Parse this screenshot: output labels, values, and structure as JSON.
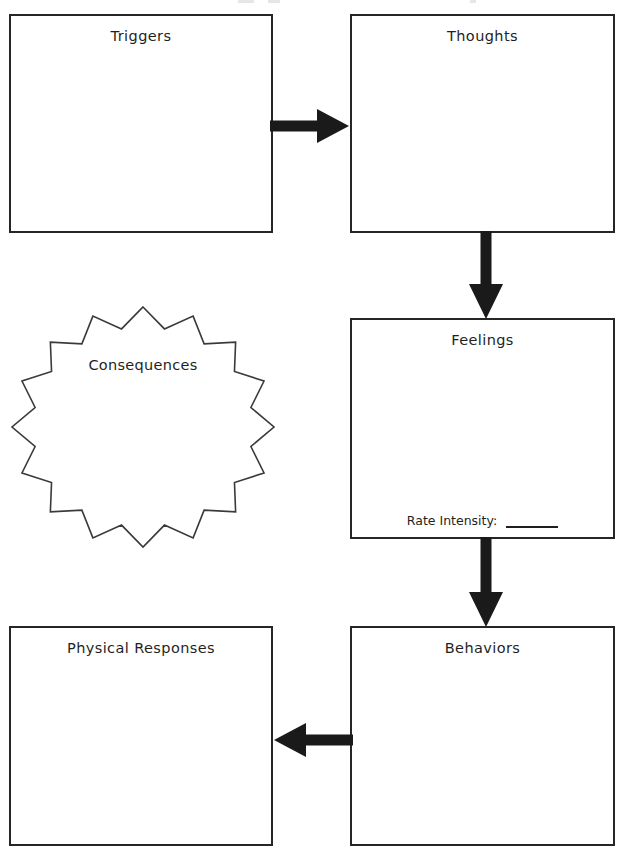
{
  "worksheet": {
    "title": "CBT Cycle Worksheet",
    "background_color": "#ffffff",
    "line_color": "#262626",
    "text_color": "#1f1f1f"
  },
  "boxes": [
    {
      "id": "triggers",
      "label": "Triggers"
    },
    {
      "id": "thoughts",
      "label": "Thoughts"
    },
    {
      "id": "feelings",
      "label": "Feelings"
    },
    {
      "id": "behaviors",
      "label": "Behaviors"
    },
    {
      "id": "physical",
      "label": "Physical Responses"
    }
  ],
  "feelings": {
    "label": "Feelings",
    "rate_intensity_label": "Rate Intensity:",
    "rate_intensity_value": ""
  },
  "starburst": {
    "label": "Consequences",
    "points": 16
  },
  "arrows": [
    {
      "id": "triggers-thoughts",
      "direction": "right"
    },
    {
      "id": "thoughts-feelings",
      "direction": "down"
    },
    {
      "id": "feelings-behaviors",
      "direction": "down"
    },
    {
      "id": "behaviors-physical",
      "direction": "left"
    }
  ]
}
